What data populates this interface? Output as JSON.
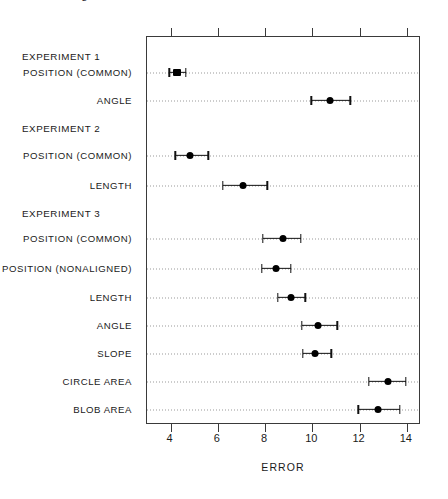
{
  "caption": {
    "text": "Error bars: logs of midmeans of absolute errors with 95% confidence intervals"
  },
  "chart_data": {
    "type": "scatter",
    "title": "",
    "subtitle": "",
    "xlabel": "ERROR",
    "ylabel": "",
    "xlim": [
      3.0,
      14.6
    ],
    "ylim": [
      0,
      13
    ],
    "grid": "horizontal-dotted-per-row",
    "legend": "none",
    "orientation": "horizontal",
    "xticks": [
      4,
      6,
      8,
      10,
      12,
      14
    ],
    "xtick_labels": [
      "4",
      "6",
      "8",
      "10",
      "12",
      "14"
    ],
    "rows": [
      {
        "kind": "group",
        "label": "EXPERIMENT 1",
        "y": 56
      },
      {
        "kind": "data",
        "label": "POSITION (COMMON)",
        "y": 72,
        "value": 4.25,
        "low": 3.95,
        "high": 4.65,
        "marker": "square"
      },
      {
        "kind": "data",
        "label": "ANGLE",
        "y": 100,
        "value": 10.75,
        "low": 9.95,
        "high": 11.6,
        "marker": "circle"
      },
      {
        "kind": "group",
        "label": "EXPERIMENT 2",
        "y": 128
      },
      {
        "kind": "data",
        "label": "POSITION (COMMON)",
        "y": 155,
        "value": 4.8,
        "low": 4.2,
        "high": 5.6,
        "marker": "circle"
      },
      {
        "kind": "data",
        "label": "LENGTH",
        "y": 185,
        "value": 7.05,
        "low": 6.2,
        "high": 8.1,
        "marker": "circle"
      },
      {
        "kind": "group",
        "label": "EXPERIMENT 3",
        "y": 213
      },
      {
        "kind": "data",
        "label": "POSITION (COMMON)",
        "y": 238,
        "value": 8.75,
        "low": 7.9,
        "high": 9.5,
        "marker": "circle"
      },
      {
        "kind": "data",
        "label": "POSITION (NONALIGNED)",
        "y": 268,
        "value": 8.45,
        "low": 7.85,
        "high": 9.1,
        "marker": "circle"
      },
      {
        "kind": "data",
        "label": "LENGTH",
        "y": 297,
        "value": 9.1,
        "low": 8.55,
        "high": 9.7,
        "marker": "circle"
      },
      {
        "kind": "data",
        "label": "ANGLE",
        "y": 325,
        "value": 10.25,
        "low": 9.55,
        "high": 11.05,
        "marker": "circle"
      },
      {
        "kind": "data",
        "label": "SLOPE",
        "y": 353,
        "value": 10.1,
        "low": 9.6,
        "high": 10.8,
        "marker": "circle"
      },
      {
        "kind": "data",
        "label": "CIRCLE AREA",
        "y": 381,
        "value": 13.2,
        "low": 12.4,
        "high": 13.95,
        "marker": "circle"
      },
      {
        "kind": "data",
        "label": "BLOB AREA",
        "y": 409,
        "value": 12.8,
        "low": 11.95,
        "high": 13.7,
        "marker": "circle"
      }
    ]
  },
  "colors": {
    "marker": "#000000",
    "frame": "#3a3a3a",
    "guide": "#9a9a9a",
    "text": "#1a1a1a",
    "background": "#ffffff"
  }
}
